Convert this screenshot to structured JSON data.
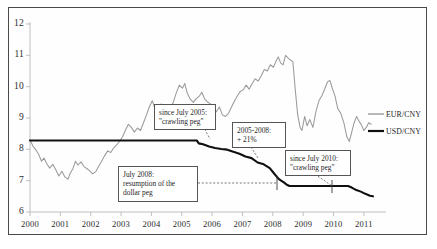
{
  "chart_data": {
    "type": "line",
    "title": "",
    "xlabel": "",
    "ylabel": "",
    "xlim": [
      2000,
      2011.4
    ],
    "ylim": [
      6,
      12
    ],
    "grid": false,
    "legend_position": "right",
    "xticks": [
      "2000",
      "2001",
      "2002",
      "2003",
      "2004",
      "2005",
      "2006",
      "2007",
      "2008",
      "2009",
      "2010",
      "2011"
    ],
    "yticks": [
      "6",
      "7",
      "8",
      "9",
      "10",
      "11",
      "12"
    ],
    "series": [
      {
        "name": "EUR/CNY",
        "color": "#9a9a9a",
        "points": [
          [
            2000.0,
            8.3
          ],
          [
            2000.1,
            8.1
          ],
          [
            2000.18,
            8.0
          ],
          [
            2000.28,
            7.85
          ],
          [
            2000.38,
            7.62
          ],
          [
            2000.46,
            7.72
          ],
          [
            2000.55,
            7.55
          ],
          [
            2000.65,
            7.4
          ],
          [
            2000.75,
            7.52
          ],
          [
            2000.85,
            7.35
          ],
          [
            2000.95,
            7.15
          ],
          [
            2001.05,
            7.3
          ],
          [
            2001.15,
            7.12
          ],
          [
            2001.25,
            7.05
          ],
          [
            2001.32,
            7.22
          ],
          [
            2001.42,
            7.4
          ],
          [
            2001.5,
            7.62
          ],
          [
            2001.58,
            7.5
          ],
          [
            2001.68,
            7.6
          ],
          [
            2001.78,
            7.45
          ],
          [
            2001.88,
            7.38
          ],
          [
            2001.96,
            7.32
          ],
          [
            2002.06,
            7.22
          ],
          [
            2002.16,
            7.28
          ],
          [
            2002.26,
            7.45
          ],
          [
            2002.36,
            7.62
          ],
          [
            2002.46,
            7.8
          ],
          [
            2002.56,
            7.95
          ],
          [
            2002.66,
            7.9
          ],
          [
            2002.76,
            8.05
          ],
          [
            2002.86,
            8.15
          ],
          [
            2002.95,
            8.25
          ],
          [
            2003.05,
            8.4
          ],
          [
            2003.14,
            8.6
          ],
          [
            2003.24,
            8.8
          ],
          [
            2003.34,
            8.7
          ],
          [
            2003.44,
            8.55
          ],
          [
            2003.54,
            8.68
          ],
          [
            2003.64,
            8.6
          ],
          [
            2003.74,
            8.85
          ],
          [
            2003.84,
            9.1
          ],
          [
            2003.93,
            9.35
          ],
          [
            2004.03,
            9.55
          ],
          [
            2004.12,
            9.3
          ],
          [
            2004.22,
            9.1
          ],
          [
            2004.32,
            9.45
          ],
          [
            2004.42,
            9.2
          ],
          [
            2004.52,
            9.32
          ],
          [
            2004.62,
            9.28
          ],
          [
            2004.72,
            9.5
          ],
          [
            2004.82,
            9.8
          ],
          [
            2004.92,
            10.05
          ],
          [
            2005.02,
            9.95
          ],
          [
            2005.1,
            10.1
          ],
          [
            2005.18,
            9.8
          ],
          [
            2005.28,
            9.6
          ],
          [
            2005.38,
            9.5
          ],
          [
            2005.48,
            9.62
          ],
          [
            2005.58,
            9.7
          ],
          [
            2005.66,
            9.82
          ],
          [
            2005.76,
            9.6
          ],
          [
            2005.86,
            9.5
          ],
          [
            2005.95,
            9.45
          ],
          [
            2006.05,
            9.28
          ],
          [
            2006.14,
            9.2
          ],
          [
            2006.24,
            9.35
          ],
          [
            2006.34,
            9.1
          ],
          [
            2006.44,
            9.05
          ],
          [
            2006.54,
            9.15
          ],
          [
            2006.64,
            9.35
          ],
          [
            2006.74,
            9.55
          ],
          [
            2006.84,
            9.72
          ],
          [
            2006.93,
            9.85
          ],
          [
            2007.03,
            9.9
          ],
          [
            2007.12,
            10.05
          ],
          [
            2007.22,
            9.92
          ],
          [
            2007.32,
            10.1
          ],
          [
            2007.42,
            10.25
          ],
          [
            2007.52,
            10.18
          ],
          [
            2007.62,
            10.35
          ],
          [
            2007.72,
            10.55
          ],
          [
            2007.82,
            10.5
          ],
          [
            2007.92,
            10.7
          ],
          [
            2008.02,
            10.62
          ],
          [
            2008.1,
            10.8
          ],
          [
            2008.18,
            10.95
          ],
          [
            2008.26,
            10.75
          ],
          [
            2008.34,
            10.7
          ],
          [
            2008.42,
            11.0
          ],
          [
            2008.5,
            10.92
          ],
          [
            2008.58,
            10.85
          ],
          [
            2008.66,
            10.8
          ],
          [
            2008.74,
            9.9
          ],
          [
            2008.82,
            9.1
          ],
          [
            2008.9,
            8.7
          ],
          [
            2008.96,
            8.6
          ],
          [
            2009.05,
            9.05
          ],
          [
            2009.13,
            8.75
          ],
          [
            2009.22,
            8.95
          ],
          [
            2009.32,
            8.7
          ],
          [
            2009.42,
            9.2
          ],
          [
            2009.52,
            9.55
          ],
          [
            2009.62,
            9.72
          ],
          [
            2009.72,
            9.95
          ],
          [
            2009.8,
            10.15
          ],
          [
            2009.88,
            10.2
          ],
          [
            2009.96,
            9.95
          ],
          [
            2010.05,
            9.7
          ],
          [
            2010.14,
            9.3
          ],
          [
            2010.24,
            9.15
          ],
          [
            2010.34,
            8.85
          ],
          [
            2010.44,
            8.4
          ],
          [
            2010.52,
            8.25
          ],
          [
            2010.6,
            8.55
          ],
          [
            2010.68,
            8.85
          ],
          [
            2010.76,
            9.05
          ],
          [
            2010.84,
            8.9
          ],
          [
            2010.92,
            8.78
          ],
          [
            2011.0,
            8.6
          ],
          [
            2011.08,
            8.7
          ],
          [
            2011.16,
            8.85
          ],
          [
            2011.24,
            8.8
          ]
        ]
      },
      {
        "name": "USD/CNY",
        "color": "#101010",
        "points": [
          [
            2000.0,
            8.28
          ],
          [
            2001.0,
            8.28
          ],
          [
            2002.0,
            8.28
          ],
          [
            2003.0,
            8.28
          ],
          [
            2004.0,
            8.28
          ],
          [
            2005.0,
            8.28
          ],
          [
            2005.5,
            8.28
          ],
          [
            2005.56,
            8.19
          ],
          [
            2005.7,
            8.16
          ],
          [
            2005.9,
            8.09
          ],
          [
            2006.1,
            8.04
          ],
          [
            2006.3,
            8.01
          ],
          [
            2006.5,
            7.99
          ],
          [
            2006.7,
            7.92
          ],
          [
            2006.9,
            7.86
          ],
          [
            2007.1,
            7.77
          ],
          [
            2007.3,
            7.72
          ],
          [
            2007.5,
            7.58
          ],
          [
            2007.7,
            7.52
          ],
          [
            2007.9,
            7.4
          ],
          [
            2008.05,
            7.22
          ],
          [
            2008.2,
            7.05
          ],
          [
            2008.35,
            6.95
          ],
          [
            2008.48,
            6.86
          ],
          [
            2008.55,
            6.83
          ],
          [
            2009.0,
            6.83
          ],
          [
            2009.5,
            6.83
          ],
          [
            2010.0,
            6.83
          ],
          [
            2010.3,
            6.83
          ],
          [
            2010.48,
            6.83
          ],
          [
            2010.6,
            6.78
          ],
          [
            2010.75,
            6.7
          ],
          [
            2010.9,
            6.65
          ],
          [
            2011.05,
            6.58
          ],
          [
            2011.2,
            6.52
          ],
          [
            2011.3,
            6.5
          ]
        ]
      }
    ],
    "annotations": [
      {
        "id": "crawling-peg-2005",
        "text_lines": [
          "since July 2005:",
          "\"crawling peg\""
        ]
      },
      {
        "id": "appreciation-2005-2008",
        "text_lines": [
          "2005-2008:",
          "+ 21%"
        ]
      },
      {
        "id": "dollar-peg-2008",
        "text_lines": [
          "July 2008:",
          "resumption of the",
          "dollar peg"
        ]
      },
      {
        "id": "crawling-peg-2010",
        "text_lines": [
          "since July 2010:",
          "\"crawling peg\""
        ]
      }
    ],
    "legend": [
      {
        "label": "EUR/CNY",
        "color": "#9a9a9a"
      },
      {
        "label": "USD/CNY",
        "color": "#101010"
      }
    ]
  }
}
